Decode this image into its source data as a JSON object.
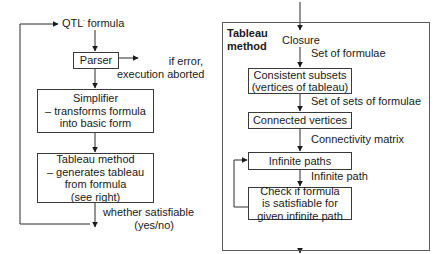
{
  "left_panel": {
    "input_label": "QTL",
    "input_label_mark": "'",
    "input_label_suffix": " formula",
    "parser": {
      "label": "Parser"
    },
    "parser_error": {
      "line1": "if error,",
      "line2": "execution aborted"
    },
    "simplifier": {
      "line1": "Simplifier",
      "line2": "– transforms formula",
      "line3": "into basic form"
    },
    "tableau": {
      "line1": "Tableau method",
      "line2": "– generates tableau",
      "line3": "from formula",
      "line4": "(see right)"
    },
    "output": {
      "line1": "whether satisfiable",
      "line2": "(yes/no)"
    }
  },
  "right_panel": {
    "title_line1": "Tableau",
    "title_line2": "method",
    "closure": "Closure",
    "edge1": "Set of formulae",
    "consistent": {
      "line1": "Consistent subsets",
      "line2": "(vertices of tableau)"
    },
    "edge2": "Set of sets of formulae",
    "connected": "Connected vertices",
    "edge3": "Connectivity matrix",
    "infinite_paths": "Infinite paths",
    "edge4": "Infinite path",
    "check": {
      "line1": "Check if formula",
      "line2": "is satisfiable for",
      "line3": "given infinite path"
    }
  },
  "colors": {
    "line": "#2a2a2a",
    "frame": "#5a5a5a",
    "background": "#ffffff"
  }
}
